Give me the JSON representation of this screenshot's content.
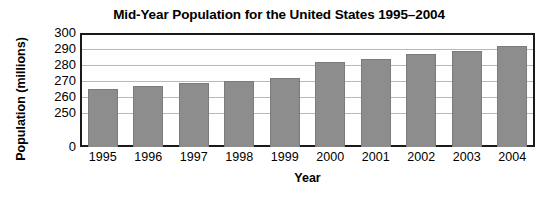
{
  "chart_data": {
    "type": "bar",
    "title": "Mid-Year Population for the United States 1995–2004",
    "xlabel": "Year",
    "ylabel": "Population (millions)",
    "categories": [
      "1995",
      "1996",
      "1997",
      "1998",
      "1999",
      "2000",
      "2001",
      "2002",
      "2003",
      "2004"
    ],
    "values": [
      266,
      268,
      270,
      271,
      273,
      283,
      285,
      288,
      290,
      293
    ],
    "series": [
      {
        "name": "Mid-Year Population",
        "values": [
          266,
          268,
          270,
          271,
          273,
          283,
          285,
          288,
          290,
          293
        ]
      }
    ],
    "ytick_labels": [
      "300",
      "290",
      "280",
      "270",
      "260",
      "250",
      "0"
    ],
    "ytick_values": [
      300,
      290,
      280,
      270,
      260,
      250,
      0
    ],
    "ylim": [
      250,
      300
    ],
    "axis_break": true,
    "grid": "horizontal",
    "legend": "none",
    "bar_color": "#8d8d8d",
    "frame_color": "#1a1a1a",
    "gridline_color": "#b9b9b9",
    "background_color": "#ffffff"
  }
}
